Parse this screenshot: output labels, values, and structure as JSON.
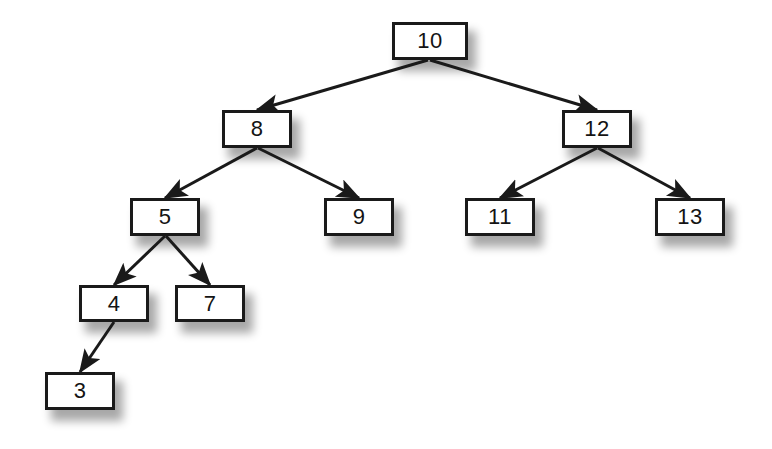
{
  "diagram": {
    "type": "binary-search-tree",
    "node_count": 10,
    "root_value": "10",
    "colors": {
      "node_fill": "#ffffff",
      "node_border": "#1a1a1a",
      "edge": "#1a1a1a",
      "text": "#141414",
      "background": "#ffffff"
    },
    "nodes": [
      {
        "id": "n10",
        "label": "10",
        "x": 392,
        "y": 22,
        "w": 76,
        "h": 38,
        "level": 0
      },
      {
        "id": "n8",
        "label": "8",
        "x": 222,
        "y": 110,
        "w": 70,
        "h": 38,
        "level": 1
      },
      {
        "id": "n12",
        "label": "12",
        "x": 562,
        "y": 110,
        "w": 70,
        "h": 38,
        "level": 1
      },
      {
        "id": "n5",
        "label": "5",
        "x": 130,
        "y": 198,
        "w": 70,
        "h": 38,
        "level": 2
      },
      {
        "id": "n9",
        "label": "9",
        "x": 324,
        "y": 198,
        "w": 70,
        "h": 38,
        "level": 2
      },
      {
        "id": "n11",
        "label": "11",
        "x": 465,
        "y": 198,
        "w": 70,
        "h": 38,
        "level": 2
      },
      {
        "id": "n13",
        "label": "13",
        "x": 655,
        "y": 198,
        "w": 70,
        "h": 38,
        "level": 2
      },
      {
        "id": "n4",
        "label": "4",
        "x": 79,
        "y": 285,
        "w": 70,
        "h": 37,
        "level": 3
      },
      {
        "id": "n7",
        "label": "7",
        "x": 175,
        "y": 285,
        "w": 70,
        "h": 37,
        "level": 3
      },
      {
        "id": "n3",
        "label": "3",
        "x": 45,
        "y": 372,
        "w": 70,
        "h": 38,
        "level": 4
      }
    ],
    "edges": [
      {
        "from": "n10",
        "to": "n8",
        "side": "left",
        "x1": 428,
        "y1": 60,
        "x2": 257,
        "y2": 110
      },
      {
        "from": "n10",
        "to": "n12",
        "side": "right",
        "x1": 430,
        "y1": 60,
        "x2": 597,
        "y2": 110
      },
      {
        "from": "n8",
        "to": "n5",
        "side": "left",
        "x1": 257,
        "y1": 148,
        "x2": 165,
        "y2": 198
      },
      {
        "from": "n8",
        "to": "n9",
        "side": "right",
        "x1": 258,
        "y1": 148,
        "x2": 359,
        "y2": 198
      },
      {
        "from": "n12",
        "to": "n11",
        "side": "left",
        "x1": 597,
        "y1": 148,
        "x2": 500,
        "y2": 198
      },
      {
        "from": "n12",
        "to": "n13",
        "side": "right",
        "x1": 598,
        "y1": 148,
        "x2": 690,
        "y2": 198
      },
      {
        "from": "n5",
        "to": "n4",
        "side": "left",
        "x1": 165,
        "y1": 236,
        "x2": 114,
        "y2": 285
      },
      {
        "from": "n5",
        "to": "n7",
        "side": "right",
        "x1": 166,
        "y1": 236,
        "x2": 210,
        "y2": 285
      },
      {
        "from": "n4",
        "to": "n3",
        "side": "left",
        "x1": 114,
        "y1": 322,
        "x2": 80,
        "y2": 372
      }
    ]
  }
}
